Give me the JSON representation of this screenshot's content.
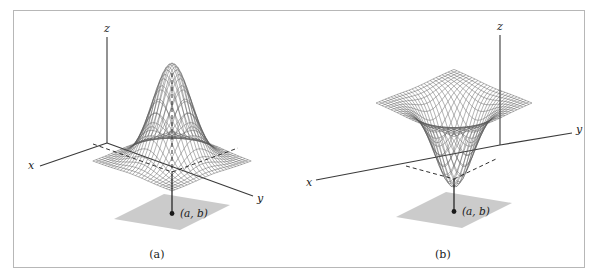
{
  "figure": {
    "background_color": "#ffffff",
    "frame_color": "#b7b7b7",
    "ink_color": "#1a1a1a",
    "mesh_color": "#555555",
    "base_plane_color": "#cccccc"
  },
  "panels": [
    {
      "id": "a",
      "caption": "(a)",
      "axis_labels": {
        "x": "x",
        "y": "y",
        "z": "z"
      },
      "point_label": "(a, b)",
      "surface_type": "local-maximum-peak"
    },
    {
      "id": "b",
      "caption": "(b)",
      "axis_labels": {
        "x": "x",
        "y": "y",
        "z": "z"
      },
      "point_label": "(a, b)",
      "surface_type": "local-minimum-well"
    }
  ],
  "chart_data": {
    "type": "line",
    "title": "",
    "xlabel": "x",
    "ylabel": "y",
    "zlabel": "z",
    "grid": false,
    "legend": null,
    "plots": [
      {
        "panel": "(a)",
        "kind": "surface-wireframe-3d",
        "function": "z = exp(-((x-a)^2 + (y-b)^2))",
        "description": "Gaussian bump: surface has a local maximum directly above the point (a, b) in the xy-plane.",
        "critical_point": {
          "label": "(a, b)",
          "type": "local maximum"
        },
        "mesh_rows": 26,
        "mesh_cols": 26,
        "x_range": [
          -3,
          3
        ],
        "y_range": [
          -3,
          3
        ],
        "z_range": [
          0,
          1
        ],
        "annotations": [
          "(a, b)",
          "x",
          "y",
          "z",
          "(a)"
        ]
      },
      {
        "panel": "(b)",
        "kind": "surface-wireframe-3d",
        "function": "z = -exp(-((x-a)^2 + (y-b)^2))",
        "description": "Inverted Gaussian well: surface has a local minimum directly above the point (a, b) in the xy-plane.",
        "critical_point": {
          "label": "(a, b)",
          "type": "local minimum"
        },
        "mesh_rows": 26,
        "mesh_cols": 26,
        "x_range": [
          -3,
          3
        ],
        "y_range": [
          -3,
          3
        ],
        "z_range": [
          -1,
          0
        ],
        "annotations": [
          "(a, b)",
          "x",
          "y",
          "z",
          "(b)"
        ]
      }
    ]
  }
}
